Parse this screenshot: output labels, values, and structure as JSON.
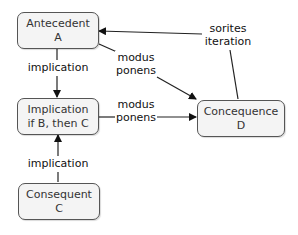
{
  "nodes": {
    "antecedent": {
      "line1": "Antecedent",
      "line2": "A"
    },
    "implication": {
      "line1": "Implication",
      "line2": "if B, then C"
    },
    "consequent": {
      "line1": "Consequent",
      "line2": "C"
    },
    "concequence": {
      "line1": "Concequence",
      "line2": "D"
    }
  },
  "edges": {
    "implication_top": {
      "line1": "implication"
    },
    "implication_bottom": {
      "line1": "implication"
    },
    "modus_ponens_top": {
      "line1": "modus",
      "line2": "ponens"
    },
    "modus_ponens_mid": {
      "line1": "modus",
      "line2": "ponens"
    },
    "sorites": {
      "line1": "sorites",
      "line2": "iteration"
    }
  },
  "colors": {
    "node_fill": "#f4f4f4",
    "node_border": "#555555",
    "edge": "#111111"
  }
}
